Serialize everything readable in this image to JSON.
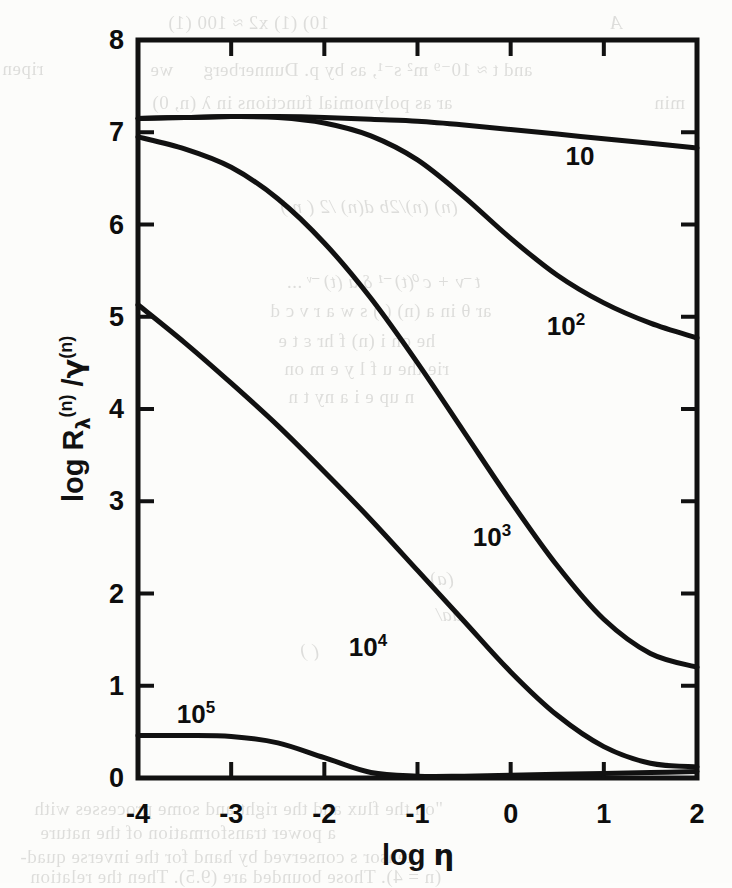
{
  "figure": {
    "axes": {
      "x_title_prefix": "log",
      "x_title_symbol": "η",
      "y_title_prefix": "log",
      "y_title_main": "R",
      "y_title_sub": "λ",
      "y_title_sup": "(n)",
      "y_title_divider": "/",
      "y_title_denom": "γ",
      "y_title_denom_sup": "(n)",
      "x_ticks": [
        "-4",
        "-3",
        "-2",
        "-1",
        "0",
        "1",
        "2"
      ],
      "y_ticks": [
        "0",
        "1",
        "2",
        "3",
        "4",
        "5",
        "6",
        "7",
        "8"
      ]
    },
    "curve_labels": [
      {
        "text": "10",
        "sup": "",
        "x": 580,
        "y": 156
      },
      {
        "text": "10",
        "sup": "2",
        "x": 566,
        "y": 326
      },
      {
        "text": "10",
        "sup": "3",
        "x": 492,
        "y": 537
      },
      {
        "text": "10",
        "sup": "4",
        "x": 368,
        "y": 647
      },
      {
        "text": "10",
        "sup": "5",
        "x": 196,
        "y": 714
      }
    ]
  },
  "chart_data": {
    "type": "line",
    "title": "",
    "xlabel": "log η",
    "ylabel": "log R_λ^(n) / γ^(n)",
    "xlim": [
      -4,
      2
    ],
    "ylim": [
      0,
      8
    ],
    "xticks": [
      -4,
      -3,
      -2,
      -1,
      0,
      1,
      2
    ],
    "yticks": [
      0,
      1,
      2,
      3,
      4,
      5,
      6,
      7,
      8
    ],
    "grid": false,
    "legend": "inline-curve-labels",
    "x": [
      -4.0,
      -3.5,
      -3.0,
      -2.5,
      -2.0,
      -1.5,
      -1.0,
      -0.5,
      0.0,
      0.5,
      1.0,
      1.5,
      2.0
    ],
    "series": [
      {
        "name": "10",
        "label": "10",
        "values": [
          7.15,
          7.16,
          7.17,
          7.17,
          7.16,
          7.14,
          7.12,
          7.08,
          7.03,
          6.98,
          6.93,
          6.88,
          6.83
        ]
      },
      {
        "name": "10^2",
        "label": "10²",
        "values": [
          7.15,
          7.16,
          7.17,
          7.16,
          7.1,
          6.96,
          6.7,
          6.3,
          5.85,
          5.45,
          5.15,
          4.93,
          4.77
        ]
      },
      {
        "name": "10^3",
        "label": "10³",
        "values": [
          6.95,
          6.82,
          6.62,
          6.28,
          5.8,
          5.2,
          4.5,
          3.75,
          3.0,
          2.3,
          1.72,
          1.35,
          1.2
        ]
      },
      {
        "name": "10^4",
        "label": "10⁴",
        "values": [
          5.13,
          4.72,
          4.28,
          3.82,
          3.32,
          2.8,
          2.25,
          1.7,
          1.15,
          0.68,
          0.34,
          0.16,
          0.12
        ]
      },
      {
        "name": "10^5",
        "label": "10⁵",
        "values": [
          0.46,
          0.46,
          0.45,
          0.38,
          0.22,
          0.06,
          0.02,
          0.02,
          0.03,
          0.04,
          0.05,
          0.06,
          0.07
        ]
      }
    ]
  },
  "background_text": {
    "lines": [
      {
        "t": "10) (1)   x2 ≈ 100   (1)",
        "x": 168,
        "y": 12,
        "it": false
      },
      {
        "t": "A",
        "x": 610,
        "y": 12,
        "it": true
      },
      {
        "t": "and t ≈ 10⁻⁹ m² s⁻¹, as by p. Dunnerberg    we",
        "x": 150,
        "y": 58,
        "it": false
      },
      {
        "t": "ripen",
        "x": 2,
        "y": 58,
        "it": false
      },
      {
        "t": "ar as polynomial functions in λ (n, 0)",
        "x": 152,
        "y": 92,
        "it": false
      },
      {
        "t": "min",
        "x": 654,
        "y": 92,
        "it": false
      },
      {
        "t": "(n)     (n)/2b   d(n) /2    ( n )",
        "x": 280,
        "y": 196,
        "it": true
      },
      {
        "t": "t⁻ν + c⁰(t)⁻¹ δ a (t)⁻ᵛ ...",
        "x": 286,
        "y": 270,
        "it": true
      },
      {
        "t": "ar θ  in a   (n) (  ) s  w  a  r  ν  c   d",
        "x": 270,
        "y": 300,
        "it": false
      },
      {
        "t": "he  on     i (n)  f    hr   ε     t      e",
        "x": 278,
        "y": 330,
        "it": false
      },
      {
        "t": "rie    the    u   f  l    y    e   m    on",
        "x": 284,
        "y": 358,
        "it": false
      },
      {
        "t": "n  up    e  i   a   ny  t     n",
        "x": 288,
        "y": 386,
        "it": false
      },
      {
        "t": "(a)",
        "x": 430,
        "y": 568,
        "it": true
      },
      {
        "t": "da/",
        "x": 436,
        "y": 604,
        "it": true
      },
      {
        "t": "( )",
        "x": 300,
        "y": 640,
        "it": true
      },
      {
        "t": "\"on  the  flux  and  the  right  and   some  processes  with",
        "x": 34,
        "y": 798,
        "it": false
      },
      {
        "t": "a   power  transformation  of  the  nature",
        "x": 40,
        "y": 822,
        "it": false
      },
      {
        "t": "tensor s  conserved by hand for  the inverse  quad-",
        "x": 20,
        "y": 846,
        "it": false
      },
      {
        "t": "(n = 4).   Those  bounded  are  (9.5).  Then  the   relation",
        "x": 30,
        "y": 866,
        "it": false
      }
    ]
  }
}
